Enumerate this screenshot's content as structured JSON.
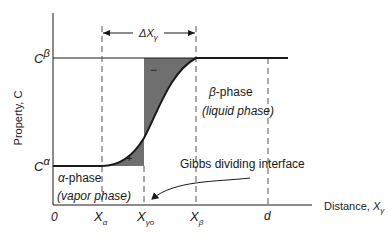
{
  "diagram": {
    "axes": {
      "y_label": "Property, C",
      "x_label_prefix": "Distance, ",
      "x_label_var": "X",
      "x_label_sub": "γ"
    },
    "levels": {
      "c_beta": {
        "base": "C",
        "sup": "β"
      },
      "c_alpha": {
        "base": "C",
        "sup": "α"
      }
    },
    "x_ticks": [
      {
        "id": "origin",
        "base": "0",
        "sub": ""
      },
      {
        "id": "x_alpha",
        "base": "X",
        "sub": "α"
      },
      {
        "id": "x_gamma_o",
        "base": "X",
        "sub": "γo"
      },
      {
        "id": "x_beta",
        "base": "X",
        "sub": "β"
      },
      {
        "id": "d",
        "base": "d",
        "sub": ""
      }
    ],
    "delta": {
      "base": "ΔX",
      "sub": "γ"
    },
    "regions": {
      "beta": {
        "name": "β-phase",
        "desc": "(liquid phase)"
      },
      "alpha": {
        "name": "α-phase",
        "desc": "(vapor phase)"
      }
    },
    "shaded_signs": {
      "upper": "−",
      "lower": "+"
    },
    "annotation": "Gibbs dividing interface",
    "colors": {
      "shade": "#6f6f6f",
      "line": "#1a1a1a",
      "dash": "#555555"
    }
  }
}
